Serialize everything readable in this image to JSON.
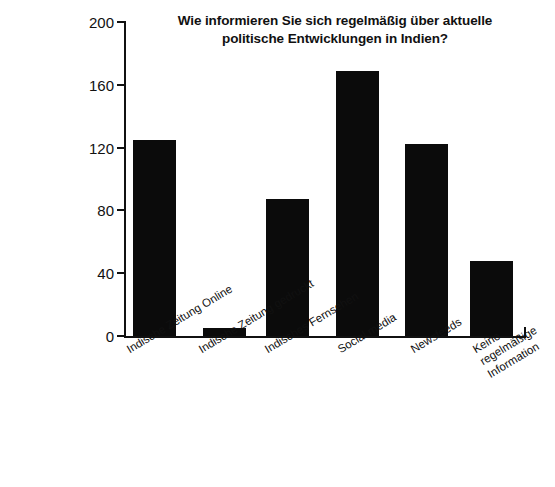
{
  "chart_data": {
    "type": "bar",
    "title": "Wie informieren Sie sich regelmäßig über aktuelle\npolitische Entwicklungen in Indien?",
    "xlabel": "",
    "ylabel": "",
    "ylim": [
      0,
      200
    ],
    "yticks": [
      0,
      40,
      80,
      120,
      160,
      200
    ],
    "grid": false,
    "legend": false,
    "bar_color": "#0b0b0b",
    "categories": [
      "Indische Zeitung Online",
      "Indische Zeitung gedruckt",
      "Indisches Fernsehen",
      "Social media",
      "Newsfeeds",
      "Keine regelmäßige\nInformation"
    ],
    "values": [
      125,
      5,
      87,
      169,
      122,
      48
    ]
  },
  "axis": {
    "tick_labels": [
      "200",
      "160",
      "120",
      "80",
      "40",
      "0"
    ]
  },
  "caption": {
    "partial_text": ""
  }
}
